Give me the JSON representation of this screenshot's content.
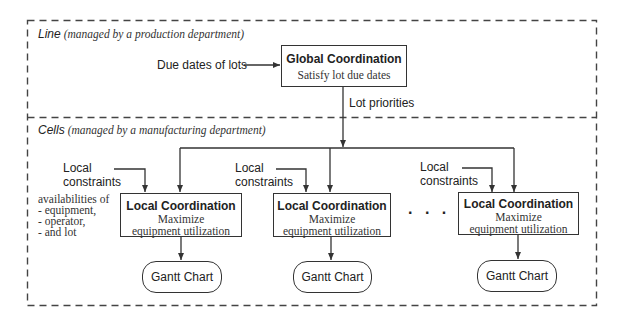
{
  "line_section": {
    "label": "Line",
    "label_note": "(managed by a production department)",
    "input_label": "Due dates of lots",
    "global_box": {
      "title": "Global Coordination",
      "subtitle": "Satisfy lot due dates"
    },
    "output_label": "Lot priorities"
  },
  "cells_section": {
    "label": "Cells",
    "label_note": "(managed by a manufacturing department)",
    "availabilities": {
      "heading": "availabilities of",
      "items": [
        "- equipment,",
        "- operator,",
        "- and lot"
      ]
    },
    "ellipsis": ". . .",
    "cells": [
      {
        "constraint_line1": "Local",
        "constraint_line2": "constraints",
        "title": "Local Coordination",
        "sub1": "Maximize",
        "sub2": "equipment utilization",
        "gantt": "Gantt Chart"
      },
      {
        "constraint_line1": "Local",
        "constraint_line2": "constraints",
        "title": "Local Coordination",
        "sub1": "Maximize",
        "sub2": "equipment utilization",
        "gantt": "Gantt Chart"
      },
      {
        "constraint_line1": "Local",
        "constraint_line2": "constraints",
        "title": "Local Coordination",
        "sub1": "Maximize",
        "sub2": "equipment utilization",
        "gantt": "Gantt Chart"
      }
    ]
  }
}
